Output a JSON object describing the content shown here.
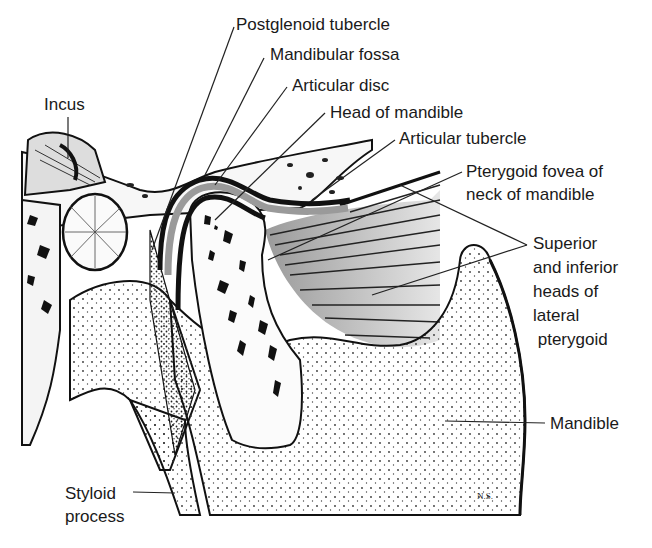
{
  "diagram": {
    "signature": "N.S.",
    "labels": [
      {
        "id": "postglenoid-tubercle",
        "text": "Postglenoid tubercle",
        "x": 236,
        "y": 15
      },
      {
        "id": "mandibular-fossa",
        "text": "Mandibular fossa",
        "x": 270,
        "y": 45
      },
      {
        "id": "articular-disc",
        "text": "Articular disc",
        "x": 292,
        "y": 76
      },
      {
        "id": "head-of-mandible",
        "text": "Head of mandible",
        "x": 330,
        "y": 103
      },
      {
        "id": "articular-tubercle",
        "text": "Articular tubercle",
        "x": 399,
        "y": 129
      },
      {
        "id": "pterygoid-fovea",
        "text": "Pterygoid fovea of\nneck of mandible",
        "x": 466,
        "y": 160
      },
      {
        "id": "lateral-pterygoid",
        "text": "Superior\nand inferior\nheads of\nlateral\n pterygoid",
        "x": 533,
        "y": 232
      },
      {
        "id": "incus",
        "text": "Incus",
        "x": 44,
        "y": 95
      },
      {
        "id": "mandible",
        "text": "Mandible",
        "x": 550,
        "y": 414
      },
      {
        "id": "styloid-process",
        "text": "Styloid\nprocess",
        "x": 65,
        "y": 482
      }
    ]
  }
}
